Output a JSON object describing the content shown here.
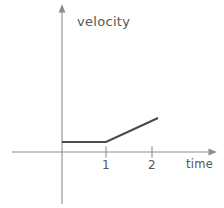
{
  "figure": {
    "background_color": "#ffffff",
    "axis_color": "#8e8e8e",
    "data_color": "#4a4a4a",
    "text_color": "#555555"
  },
  "axes": {
    "y": {
      "label": "velocity",
      "arrow": "up-arrow-icon",
      "origin_px": 62,
      "top_px": 6,
      "bottom_px": 204
    },
    "x": {
      "label": "time",
      "arrow": "right-arrow-icon",
      "baseline_px": 152,
      "left_px": 12,
      "right_px": 216,
      "ticks": [
        {
          "label": "1",
          "x_px": 106
        },
        {
          "label": "2",
          "x_px": 152
        }
      ]
    }
  },
  "chart_data": {
    "type": "line",
    "title": "",
    "subtitle": "",
    "xlabel": "time",
    "ylabel": "velocity",
    "xlim": [
      0,
      2.1
    ],
    "ylim": [
      0,
      0.75
    ],
    "grid": false,
    "legend": null,
    "annotations": [],
    "series": [
      {
        "name": "velocity",
        "x": [
          0,
          1,
          2.1
        ],
        "y": [
          0.21,
          0.21,
          0.73
        ],
        "description": "constant velocity from t=0 to t=1, then linear increase from t=1 to t=2.1"
      }
    ],
    "points_px": [
      {
        "x": 62,
        "y": 142
      },
      {
        "x": 106,
        "y": 142
      },
      {
        "x": 158,
        "y": 118
      }
    ]
  }
}
